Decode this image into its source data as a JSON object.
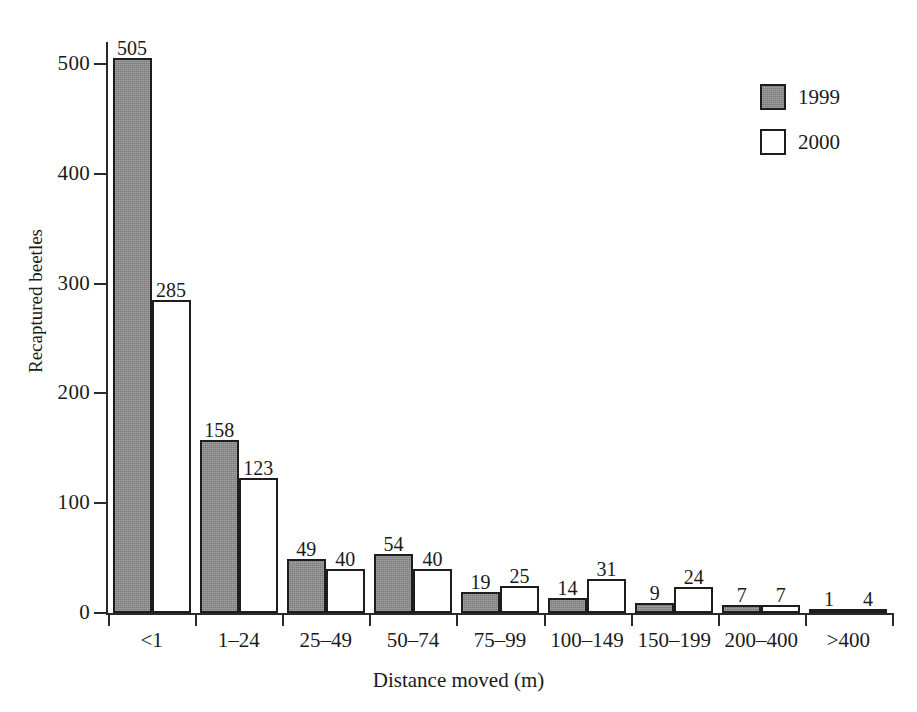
{
  "chart_data": {
    "type": "bar",
    "title": "",
    "subtitle": "",
    "xlabel": "Distance moved (m)",
    "ylabel": "Recaptured beetles",
    "categories": [
      "<1",
      "1–24",
      "25–49",
      "50–74",
      "75–99",
      "100–149",
      "150–199",
      "200–400",
      ">400"
    ],
    "series": [
      {
        "name": "1999",
        "color": "#8d8d8d",
        "values": [
          505,
          158,
          49,
          54,
          19,
          14,
          9,
          7,
          1
        ]
      },
      {
        "name": "2000",
        "color": "#ffffff",
        "values": [
          285,
          123,
          40,
          40,
          25,
          31,
          24,
          7,
          4
        ]
      }
    ],
    "ylim": [
      0,
      520
    ],
    "yticks": [
      0,
      100,
      200,
      300,
      400,
      500
    ],
    "ytick_labels": [
      "0",
      "100",
      "200",
      "300",
      "400",
      "500"
    ],
    "grid": false,
    "show_data_labels": true,
    "legend_position": "top-right",
    "bar_border_color": "#1d1d1d",
    "axis_color": "#2a2a2a"
  },
  "legend": {
    "entries": [
      {
        "label": "1999",
        "swatch": "gray-filled-square"
      },
      {
        "label": "2000",
        "swatch": "white-outlined-square"
      }
    ]
  }
}
